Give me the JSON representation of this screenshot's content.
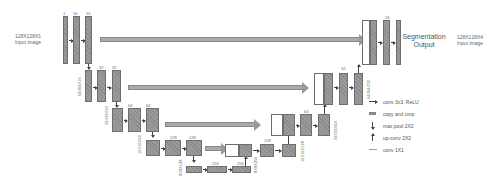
{
  "diagram": {
    "type": "U-Net architecture",
    "input": {
      "size": "128X128X1",
      "caption": "Input image"
    },
    "output": {
      "title_line1": "Segmentation",
      "title_line2": "Output",
      "size": "128X128X4",
      "caption": "Input image"
    },
    "channel_labels": {
      "enc1": [
        "1",
        "16",
        "16"
      ],
      "enc2": [
        "32",
        "32"
      ],
      "enc3": [
        "64",
        "64"
      ],
      "enc4": [
        "128",
        "128"
      ],
      "bottleneck": [
        "256",
        "256"
      ],
      "dec4": [
        "128"
      ],
      "dec3": [
        "64"
      ],
      "dec2": [
        "32"
      ],
      "dec1": [
        "16"
      ]
    },
    "size_labels": {
      "enc2": "64X64X16",
      "enc3": "32X32X32",
      "enc4": "16X16X64",
      "bottleneck": "8X8X128",
      "bottleneck_out": "8X8X256",
      "dec4": "16X16X128",
      "dec3": "32X32X64",
      "dec2": "64X64X32"
    },
    "legend": [
      {
        "icon": "arrow-right-icon",
        "label": "conv 3x3, ReLU"
      },
      {
        "icon": "copy-arrow-icon",
        "label": "copy and crop"
      },
      {
        "icon": "arrow-down-icon",
        "label": "max pool 2X2"
      },
      {
        "icon": "arrow-up-icon",
        "label": "up-conv 2X2"
      },
      {
        "icon": "line-icon",
        "label": "conv 1X1"
      }
    ]
  }
}
